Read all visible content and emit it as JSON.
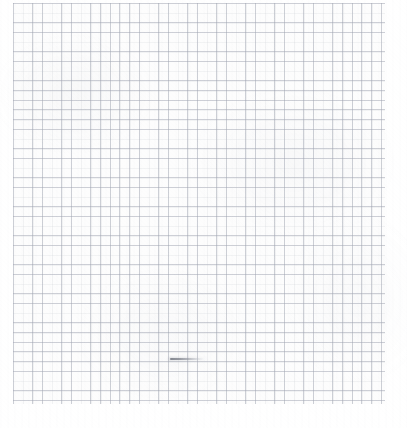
{
  "image": {
    "kind": "scanned-graph-paper",
    "description": "Blank sheet of light blue-gray graph paper, scanned, with a single short dark pencil stroke near the lower-left-of-center.",
    "width_px": 407,
    "height_px": 428,
    "background_color": "#ffffff",
    "paper_color": "#fefefe"
  },
  "grid": {
    "label": "graph-paper-grid",
    "cell_size_px": 9.68,
    "line_color": "#969baa",
    "line_opacity": 0.42,
    "line_width_px": 0.7,
    "major_lines": false,
    "region": {
      "left_px": 13,
      "top_px": 3,
      "width_px": 372,
      "height_px": 401,
      "right_px": 385,
      "bottom_px": 404
    },
    "columns": 38,
    "rows": 41
  },
  "margins": {
    "left_px": 13,
    "top_px": 3,
    "right_px": 22,
    "bottom_px": 24,
    "color": "#ffffff"
  },
  "annotations": [
    {
      "name": "pencil-stroke",
      "type": "hand-drawn-line",
      "orientation": "horizontal",
      "x_start_px": 170,
      "x_end_px": 203,
      "y_px": 359,
      "length_px": 33,
      "thickness_px": 2,
      "color": "#6e727c",
      "fade": "darkest at left, tapering to light at right"
    }
  ],
  "texture": {
    "scan_mottle": true,
    "scan_banding": true,
    "grain": true,
    "mottle_color": "#a8acb6"
  }
}
